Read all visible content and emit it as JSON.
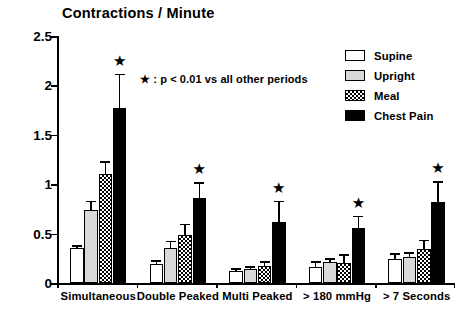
{
  "chart_data": {
    "type": "bar",
    "title": "Contractions / Minute",
    "xlabel": "",
    "ylabel": "",
    "ylim": [
      0,
      2.5
    ],
    "yticks": [
      "0",
      "0.5",
      "1",
      "1.5",
      "2",
      "2.5"
    ],
    "grid": false,
    "legend_position": "top-right",
    "categories": [
      "Simultaneous",
      "Double Peaked",
      "Multi Peaked",
      "> 180 mmHg",
      "> 7 Seconds"
    ],
    "series": [
      {
        "name": "Supine",
        "color": "#ffffff",
        "values": [
          0.35,
          0.19,
          0.12,
          0.16,
          0.24
        ],
        "errors": [
          0.03,
          0.04,
          0.03,
          0.06,
          0.06
        ]
      },
      {
        "name": "Upright",
        "color": "#d9d9d9",
        "values": [
          0.74,
          0.35,
          0.14,
          0.21,
          0.26
        ],
        "errors": [
          0.09,
          0.08,
          0.03,
          0.04,
          0.05
        ]
      },
      {
        "name": "Meal",
        "color": "#hatched",
        "values": [
          1.1,
          0.49,
          0.17,
          0.2,
          0.34
        ],
        "errors": [
          0.13,
          0.11,
          0.05,
          0.09,
          0.1
        ]
      },
      {
        "name": "Chest Pain",
        "color": "#000000",
        "values": [
          1.77,
          0.86,
          0.62,
          0.56,
          0.82
        ],
        "errors": [
          0.35,
          0.16,
          0.21,
          0.12,
          0.21
        ]
      }
    ],
    "significance_marker": "★",
    "significance_groups": [
      "Simultaneous",
      "Double Peaked",
      "Multi Peaked",
      "> 180 mmHg",
      "> 7 Seconds"
    ],
    "annotation": "★ : p < 0.01 vs all other periods"
  },
  "legend": {
    "items": [
      {
        "label": "Supine"
      },
      {
        "label": "Upright"
      },
      {
        "label": "Meal"
      },
      {
        "label": "Chest Pain"
      }
    ]
  }
}
